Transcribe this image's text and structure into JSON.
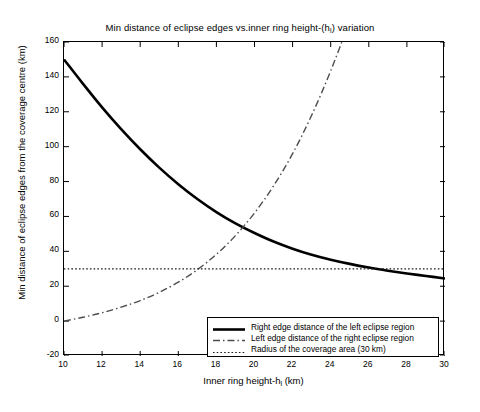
{
  "chart_data": {
    "type": "line",
    "title_main": "Min distance of eclipse edges vs.inner ring height-(h",
    "title_sub": "l",
    "title_tail": ") variation",
    "xlabel": "Inner ring height-h₁ (km)",
    "xlabel_main": "Inner ring height-h",
    "xlabel_sub": "l",
    "xlabel_tail": " (km)",
    "ylabel": "Min distance of eclipse edges from the coverage centre (km)",
    "xlim": [
      10,
      30
    ],
    "ylim": [
      -20,
      160
    ],
    "xticks": [
      10,
      12,
      14,
      16,
      18,
      20,
      22,
      24,
      26,
      28,
      30
    ],
    "yticks": [
      -20,
      0,
      20,
      40,
      60,
      80,
      100,
      120,
      140,
      160
    ],
    "grid": false,
    "legend_position": "lower-right",
    "x": [
      10,
      11,
      12,
      13,
      14,
      15,
      16,
      17,
      18,
      19,
      20,
      21,
      22,
      23,
      24,
      25,
      26,
      27,
      28,
      29,
      30
    ],
    "series": [
      {
        "name": "Right edge distance of the left eclipse region",
        "style": "solid",
        "color": "#000000",
        "width": 2.6,
        "values": [
          150.0,
          136.0,
          122.5,
          110.0,
          98.5,
          88.0,
          78.5,
          70.0,
          62.5,
          56.0,
          50.5,
          45.6,
          41.5,
          38.0,
          35.2,
          32.8,
          30.7,
          28.9,
          27.3,
          25.9,
          24.4
        ]
      },
      {
        "name": "Left edge distance of the right eclipse region",
        "style": "dashdot",
        "color": "#4d4d4d",
        "width": 1.4,
        "values": [
          0.0,
          2.2,
          4.8,
          8.0,
          11.8,
          16.5,
          22.3,
          29.5,
          38.3,
          49.0,
          62.0,
          77.5,
          96.0,
          118.0,
          143.5,
          172.5,
          205.5,
          242.5,
          283.5,
          329.0,
          379.0
        ]
      },
      {
        "name": "Radius of the coverage area (30 km)",
        "style": "dotted",
        "color": "#1a1a1a",
        "width": 1.2,
        "constant": 30,
        "values": [
          30,
          30,
          30,
          30,
          30,
          30,
          30,
          30,
          30,
          30,
          30,
          30,
          30,
          30,
          30,
          30,
          30,
          30,
          30,
          30,
          30
        ]
      }
    ],
    "legend": [
      {
        "label": "Right edge distance of the left eclipse region",
        "style": "solid"
      },
      {
        "label": "Left edge distance of the right eclipse region",
        "style": "dashdot"
      },
      {
        "label": "Radius of the coverage area (30 km)",
        "style": "dotted"
      }
    ]
  }
}
